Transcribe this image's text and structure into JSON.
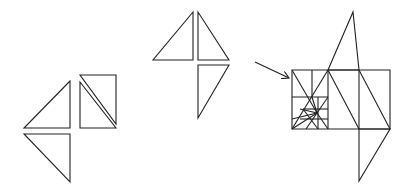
{
  "diagram": {
    "stroke_color": "#222222",
    "background": "#ffffff",
    "figures": [
      {
        "name": "left-group",
        "polygons": [
          [
            [
              70,
              81
            ],
            [
              24,
              128
            ],
            [
              70,
              128
            ]
          ],
          [
            [
              24,
              134
            ],
            [
              70,
              134
            ],
            [
              70,
              182
            ]
          ],
          [
            [
              80,
              75
            ],
            [
              116,
              75
            ],
            [
              116,
              124
            ]
          ],
          [
            [
              80,
              82
            ],
            [
              80,
              128
            ],
            [
              116,
              128
            ]
          ]
        ]
      },
      {
        "name": "middle-group",
        "polygons": [
          [
            [
              193,
              12
            ],
            [
              153,
              60
            ],
            [
              193,
              60
            ]
          ],
          [
            [
              198,
              12
            ],
            [
              198,
              60
            ],
            [
              229,
              60
            ]
          ],
          [
            [
              198,
              65
            ],
            [
              229,
              65
            ],
            [
              198,
              118
            ]
          ]
        ]
      },
      {
        "name": "right-group",
        "polygons": [
          [
            [
              292,
              70
            ],
            [
              390,
              70
            ],
            [
              390,
              129
            ],
            [
              292,
              129
            ]
          ],
          [
            [
              328,
              70
            ],
            [
              353,
              12
            ],
            [
              359,
              70
            ]
          ],
          [
            [
              359,
              129
            ],
            [
              359,
              181
            ],
            [
              390,
              129
            ]
          ]
        ],
        "lines": [
          [
            [
              328,
              70
            ],
            [
              328,
              129
            ]
          ],
          [
            [
              359,
              70
            ],
            [
              359,
              129
            ]
          ],
          [
            [
              328,
              70
            ],
            [
              359,
              129
            ]
          ],
          [
            [
              359,
              70
            ],
            [
              390,
              129
            ]
          ],
          [
            [
              312,
              70
            ],
            [
              312,
              97
            ]
          ],
          [
            [
              292,
              97
            ],
            [
              328,
              97
            ]
          ],
          [
            [
              318,
              97
            ],
            [
              318,
              129
            ]
          ],
          [
            [
              303,
              109
            ],
            [
              328,
              109
            ]
          ],
          [
            [
              300,
              119
            ],
            [
              328,
              119
            ]
          ],
          [
            [
              292,
              70
            ],
            [
              317,
              113
            ]
          ],
          [
            [
              328,
              70
            ],
            [
              292,
              129
            ]
          ],
          [
            [
              317,
              113
            ],
            [
              292,
              129
            ]
          ],
          [
            [
              317,
              113
            ],
            [
              306,
              129
            ]
          ],
          [
            [
              317,
              113
            ],
            [
              312,
              97
            ]
          ],
          [
            [
              317,
              113
            ],
            [
              328,
              97
            ]
          ],
          [
            [
              317,
              113
            ],
            [
              300,
              109
            ]
          ],
          [
            [
              317,
              113
            ],
            [
              328,
              129
            ]
          ],
          [
            [
              303,
              109
            ],
            [
              318,
              129
            ]
          ],
          [
            [
              292,
              119
            ],
            [
              317,
              113
            ]
          ]
        ]
      }
    ],
    "arrow": {
      "from": [
        255,
        62
      ],
      "to": [
        289,
        78
      ]
    }
  }
}
